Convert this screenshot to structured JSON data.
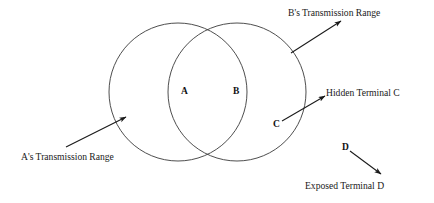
{
  "figure": {
    "type": "venn-two-circle-wireless-topology",
    "background_color": "#ffffff",
    "stroke_color": "#3a3a3a",
    "text_color": "#1a1a1a"
  },
  "circles": [
    {
      "id": "circle-a",
      "name": "A's transmission range circle",
      "cx": 178,
      "cy": 92,
      "r": 69
    },
    {
      "id": "circle-b",
      "name": "B's transmission range circle",
      "cx": 237,
      "cy": 92,
      "r": 69
    }
  ],
  "nodes": [
    {
      "id": "node-a",
      "label": "A",
      "x": 181,
      "y": 87
    },
    {
      "id": "node-b",
      "label": "B",
      "x": 233,
      "y": 87
    },
    {
      "id": "node-c",
      "label": "C",
      "x": 273,
      "y": 120
    },
    {
      "id": "node-d",
      "label": "D",
      "x": 342,
      "y": 143
    }
  ],
  "captions": [
    {
      "id": "caption-b-range",
      "label": "B's Transmission Range",
      "x": 288,
      "y": 8
    },
    {
      "id": "caption-a-range",
      "label": "A's Transmission Range",
      "x": 21,
      "y": 152
    },
    {
      "id": "caption-hidden-terminal-c",
      "label": "Hidden Terminal C",
      "x": 326,
      "y": 88
    },
    {
      "id": "caption-exposed-terminal-d",
      "label": "Exposed Terminal D",
      "x": 305,
      "y": 181
    }
  ],
  "arrows": [
    {
      "id": "arrow-b-range",
      "name": "pointer from B circle edge to B's Transmission Range caption",
      "from": {
        "x": 291,
        "y": 53
      },
      "to": {
        "x": 341,
        "y": 21
      }
    },
    {
      "id": "arrow-a-range",
      "name": "pointer from A's Transmission Range caption to A circle edge",
      "from": {
        "x": 66,
        "y": 147
      },
      "to": {
        "x": 126,
        "y": 117
      }
    },
    {
      "id": "arrow-hidden-c",
      "name": "pointer from node C to Hidden Terminal C caption",
      "from": {
        "x": 282,
        "y": 121
      },
      "to": {
        "x": 325,
        "y": 96
      }
    },
    {
      "id": "arrow-exposed-d",
      "name": "pointer from node D to Exposed Terminal D caption",
      "from": {
        "x": 350,
        "y": 151
      },
      "to": {
        "x": 381,
        "y": 174
      }
    }
  ]
}
